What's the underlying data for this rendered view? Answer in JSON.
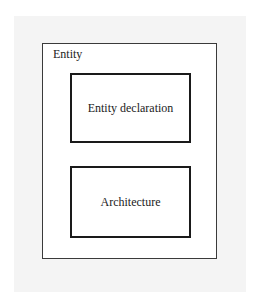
{
  "diagram": {
    "outer": {
      "label": "Entity"
    },
    "blocks": [
      {
        "label": "Entity declaration"
      },
      {
        "label": "Architecture"
      }
    ]
  },
  "colors": {
    "paper": "#f4f4f4",
    "box_fill": "#ffffff",
    "outer_border": "#3a3a3a",
    "inner_border": "#1a1a1a",
    "text": "#222222"
  }
}
